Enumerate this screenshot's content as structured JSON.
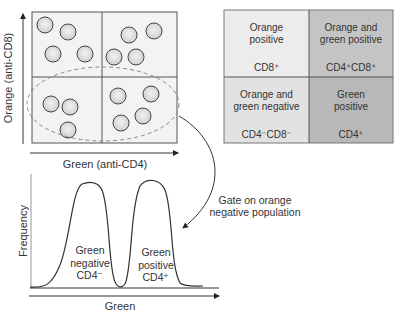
{
  "scatter_plot": {
    "y_axis_label": "Orange (anti-CD8)",
    "x_axis_label": "Green (anti-CD4)",
    "quadrants": [
      "upper-left",
      "upper-right",
      "lower-left",
      "lower-right"
    ],
    "cells_per_quadrant": [
      4,
      4,
      3,
      4
    ],
    "gate": "dashed ellipse around lower quadrants"
  },
  "legend_table": {
    "cells": [
      {
        "title": "Orange\npositive",
        "phenotype": "CD8⁺",
        "color": "#ececec"
      },
      {
        "title": "Orange and\ngreen positive",
        "phenotype": "CD4⁺CD8⁺",
        "color": "#c4c4c4"
      },
      {
        "title": "Orange and\ngreen negative",
        "phenotype": "CD4⁻CD8⁻",
        "color": "#e2e2e2"
      },
      {
        "title": "Green\npositive",
        "phenotype": "CD4⁺",
        "color": "#b8b8b8"
      }
    ]
  },
  "gate_annotation": "Gate on orange\nnegative population",
  "histogram": {
    "y_axis_label": "Frequency",
    "x_axis_label": "Green",
    "peaks": [
      {
        "label": "Green\nnegative\nCD4⁻"
      },
      {
        "label": "Green\npositive\nCD4⁺"
      }
    ]
  }
}
